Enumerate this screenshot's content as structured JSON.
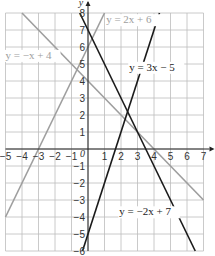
{
  "chart_data": {
    "type": "line",
    "title": "",
    "xlabel": "x",
    "ylabel": "y",
    "origin_label": "0",
    "xlim": [
      -5,
      7
    ],
    "ylim": [
      -6,
      8
    ],
    "grid": true,
    "x_ticks": [
      -5,
      -4,
      -3,
      -2,
      -1,
      1,
      2,
      3,
      4,
      5,
      6,
      7
    ],
    "y_ticks": [
      -6,
      -5,
      -4,
      -3,
      -2,
      -1,
      1,
      2,
      3,
      4,
      5,
      6,
      7,
      8
    ],
    "series": [
      {
        "name": "y = -x + 4",
        "label": "y = −x + 4",
        "slope": -1,
        "intercept": 4,
        "color": "#9e9e9e",
        "label_at": [
          -5,
          5.3
        ],
        "label_color": "#9e9e9e"
      },
      {
        "name": "y = 2x + 6",
        "label": "y = 2x + 6",
        "slope": 2,
        "intercept": 6,
        "color": "#9e9e9e",
        "label_at": [
          1.1,
          7.4
        ],
        "label_color": "#9e9e9e"
      },
      {
        "name": "y = 3x - 5",
        "label": "y = 3x − 5",
        "slope": 3,
        "intercept": -5,
        "color": "#1a1a1a",
        "label_at": [
          2.5,
          4.6
        ],
        "label_color": "#1a1a1a"
      },
      {
        "name": "y = -2x + 7",
        "label": "y = −2x + 7",
        "slope": -2,
        "intercept": 7,
        "color": "#1a1a1a",
        "label_at": [
          1.9,
          -3.9
        ],
        "label_color": "#1a1a1a"
      }
    ]
  }
}
